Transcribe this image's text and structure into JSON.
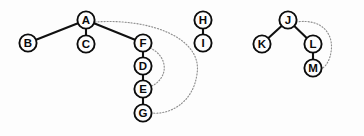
{
  "figure": {
    "title": "",
    "background_color": "#fdfdfd",
    "node_fill": "#fdfdfd",
    "node_stroke": "#0c0c0c",
    "tree_edge_color": "#111111",
    "back_edge_color": "#8f8f8f",
    "width": 364,
    "height": 136
  },
  "nodes": [
    {
      "id": "A",
      "label": "A",
      "x": 86,
      "y": 20,
      "r": 8.6,
      "component": 1
    },
    {
      "id": "B",
      "label": "B",
      "x": 28,
      "y": 43,
      "r": 8.6,
      "component": 1
    },
    {
      "id": "C",
      "label": "C",
      "x": 86,
      "y": 44,
      "r": 8.6,
      "component": 1
    },
    {
      "id": "F",
      "label": "F",
      "x": 143,
      "y": 43,
      "r": 8.6,
      "component": 1
    },
    {
      "id": "D",
      "label": "D",
      "x": 143,
      "y": 66,
      "r": 8.6,
      "component": 1
    },
    {
      "id": "E",
      "label": "E",
      "x": 143,
      "y": 89,
      "r": 8.6,
      "component": 1
    },
    {
      "id": "G",
      "label": "G",
      "x": 143,
      "y": 113,
      "r": 8.6,
      "component": 1
    },
    {
      "id": "H",
      "label": "H",
      "x": 203,
      "y": 20,
      "r": 8.6,
      "component": 2
    },
    {
      "id": "I",
      "label": "I",
      "x": 203,
      "y": 43,
      "r": 8.6,
      "component": 2
    },
    {
      "id": "J",
      "label": "J",
      "x": 288,
      "y": 20,
      "r": 8.6,
      "component": 3
    },
    {
      "id": "K",
      "label": "K",
      "x": 262,
      "y": 44,
      "r": 8.6,
      "component": 3
    },
    {
      "id": "L",
      "label": "L",
      "x": 313,
      "y": 44,
      "r": 8.6,
      "component": 3
    },
    {
      "id": "M",
      "label": "M",
      "x": 313,
      "y": 68,
      "r": 8.6,
      "component": 3
    }
  ],
  "tree_edges": [
    {
      "from": "A",
      "to": "B"
    },
    {
      "from": "A",
      "to": "C"
    },
    {
      "from": "A",
      "to": "F"
    },
    {
      "from": "F",
      "to": "D"
    },
    {
      "from": "D",
      "to": "E"
    },
    {
      "from": "E",
      "to": "G"
    },
    {
      "from": "H",
      "to": "I"
    },
    {
      "from": "J",
      "to": "K"
    },
    {
      "from": "J",
      "to": "L"
    },
    {
      "from": "L",
      "to": "M"
    }
  ],
  "back_edges": [
    {
      "from": "A",
      "to": "G",
      "path": "M 95 22 C 150 18 203 38 197 74 C 193 104 168 115 152 113"
    },
    {
      "from": "F",
      "to": "E",
      "path": "M 150 48 C 168 56 170 78 150 87"
    },
    {
      "from": "J",
      "to": "M",
      "path": "M 296 22 C 324 18 334 36 331 52 C 329 66 320 70 322 68"
    }
  ]
}
